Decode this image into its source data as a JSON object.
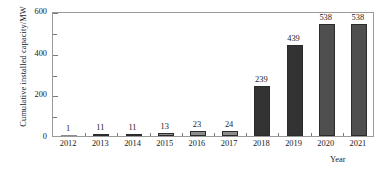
{
  "chart_data": {
    "type": "bar",
    "title": "",
    "subtitle": "",
    "xlabel": "Year",
    "ylabel": "Cumulative installed capacity/MW",
    "categories": [
      "2012",
      "2013",
      "2014",
      "2015",
      "2016",
      "2017",
      "2018",
      "2019",
      "2020",
      "2021"
    ],
    "values": [
      1,
      11,
      11,
      13,
      23,
      24,
      239,
      439,
      538,
      538
    ],
    "value_labels": [
      "1",
      "11",
      "11",
      "13",
      "23",
      "24",
      "239",
      "439",
      "538",
      "538"
    ],
    "ylim": [
      0,
      600
    ],
    "y_major_ticks": [
      0,
      200,
      400,
      600
    ],
    "y_major_tick_labels": [
      "0",
      "200",
      "400",
      "600"
    ],
    "y_minor_ticks": [
      100,
      300,
      500
    ],
    "grid": false,
    "legend": false,
    "legend_position": "none",
    "bar_colors": [
      "#8d8d8d",
      "#8d8d8d",
      "#8d8d8d",
      "#8d8d8d",
      "#8d8d8d",
      "#8d8d8d",
      "#333333",
      "#333333",
      "#4f4f4f",
      "#4f4f4f"
    ],
    "bar_edge_color": "#2b2b2b",
    "frame_color": "#9a9a9a",
    "background_color": "#ffffff",
    "text_color": "#1a1a1a"
  },
  "axes": {
    "y_title": "Cumulative installed capacity/MW",
    "x_title": "Year"
  }
}
